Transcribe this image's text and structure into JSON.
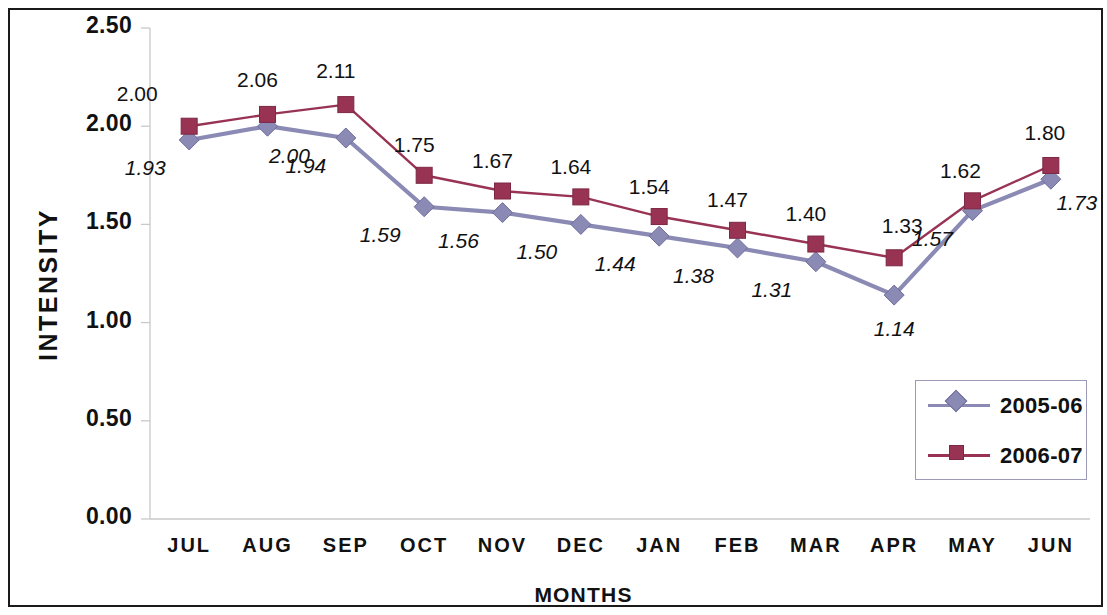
{
  "chart_data": {
    "type": "line",
    "title": "",
    "xlabel": "MONTHS",
    "ylabel": "INTENSITY",
    "categories": [
      "JUL",
      "AUG",
      "SEP",
      "OCT",
      "NOV",
      "DEC",
      "JAN",
      "FEB",
      "MAR",
      "APR",
      "MAY",
      "JUN"
    ],
    "ylim": [
      0.0,
      2.5
    ],
    "ytick_labels": [
      "2.50",
      "2.00",
      "1.50",
      "1.00",
      "0.50",
      "0.00"
    ],
    "ytick_values": [
      2.5,
      2.0,
      1.5,
      1.0,
      0.5,
      0.0
    ],
    "grid": false,
    "legend_position": "inside-right",
    "series": [
      {
        "name": "2005-06",
        "color": "#8a8ab4",
        "marker": "diamond",
        "label_style": "italic",
        "values": [
          1.93,
          2.0,
          1.94,
          1.59,
          1.56,
          1.5,
          1.44,
          1.38,
          1.31,
          1.14,
          1.57,
          1.73
        ],
        "labels": [
          "1.93",
          "2.00",
          "1.94",
          "1.59",
          "1.56",
          "1.50",
          "1.44",
          "1.38",
          "1.31",
          "1.14",
          "1.57",
          "1.73"
        ]
      },
      {
        "name": "2006-07",
        "color": "#983354",
        "marker": "square",
        "label_style": "normal",
        "values": [
          2.0,
          2.06,
          2.11,
          1.75,
          1.67,
          1.64,
          1.54,
          1.47,
          1.4,
          1.33,
          1.62,
          1.8
        ],
        "labels": [
          "2.00",
          "2.06",
          "2.11",
          "1.75",
          "1.67",
          "1.64",
          "1.54",
          "1.47",
          "1.40",
          "1.33",
          "1.62",
          "1.80"
        ]
      }
    ]
  },
  "legend": {
    "items": [
      {
        "label": "2005-06"
      },
      {
        "label": "2006-07"
      }
    ]
  },
  "axes": {
    "y_title": "INTENSITY",
    "x_title": "MONTHS"
  }
}
